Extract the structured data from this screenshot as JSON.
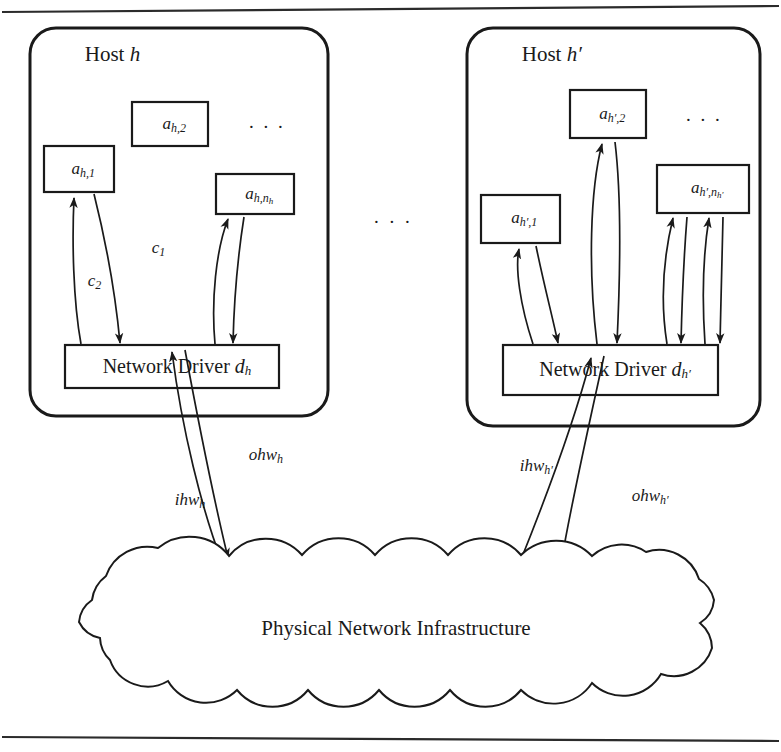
{
  "figure": {
    "title_text": "",
    "rule_color": "#2b2b2b",
    "stroke_color": "#1a1a1a",
    "background": "#ffffff"
  },
  "hosts": [
    {
      "id": "host-left",
      "label_prefix": "Host",
      "label_symbol": "h",
      "ellipsis": ". . .",
      "apps": [
        {
          "id": "app-h-1",
          "base": "a",
          "sub": "h,1"
        },
        {
          "id": "app-h-2",
          "base": "a",
          "sub": "h,2"
        },
        {
          "id": "app-h-n",
          "base": "a",
          "sub": "h,n",
          "subsub": "h"
        }
      ],
      "driver": {
        "id": "driver-h",
        "text": "Network Driver",
        "symbol_base": "d",
        "symbol_sub": "h"
      },
      "channel_labels": [
        {
          "id": "c1",
          "base": "c",
          "sub": "1"
        },
        {
          "id": "c2",
          "base": "c",
          "sub": "2"
        }
      ],
      "hw_labels": [
        {
          "id": "ohw-h",
          "base": "ohw",
          "sub": "h"
        },
        {
          "id": "ihw-h",
          "base": "ihw",
          "sub": "h"
        }
      ]
    },
    {
      "id": "host-right",
      "label_prefix": "Host",
      "label_symbol": "h′",
      "ellipsis": ". . .",
      "apps": [
        {
          "id": "app-hp-1",
          "base": "a",
          "sub": "h′,1"
        },
        {
          "id": "app-hp-2",
          "base": "a",
          "sub": "h′,2"
        },
        {
          "id": "app-hp-n",
          "base": "a",
          "sub": "h′,n",
          "subsub": "h′"
        }
      ],
      "driver": {
        "id": "driver-hp",
        "text": "Network Driver",
        "symbol_base": "d",
        "symbol_sub": "h′"
      },
      "channel_labels": [],
      "hw_labels": [
        {
          "id": "ihw-hp",
          "base": "ihw",
          "sub": "h′"
        },
        {
          "id": "ohw-hp",
          "base": "ohw",
          "sub": "h′"
        }
      ]
    }
  ],
  "between_hosts_ellipsis": ". . .",
  "cloud": {
    "id": "physical-network-cloud",
    "label": "Physical Network Infrastructure"
  }
}
